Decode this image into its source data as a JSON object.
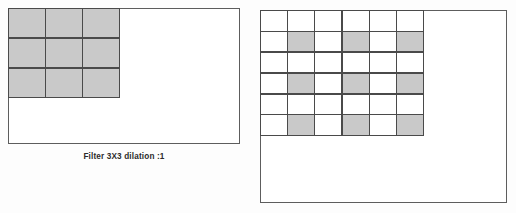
{
  "figures": [
    {
      "id": "left-filter-figure",
      "caption": "Filter 3X3 dilation :1",
      "grid": {
        "rows": 3,
        "cols": 3,
        "filled_color": "#c9c9c9",
        "empty_color": "#ffffff",
        "line_color": "#4a4a4a",
        "cells": [
          [
            1,
            1,
            1
          ],
          [
            1,
            1,
            1
          ],
          [
            1,
            1,
            1
          ]
        ]
      }
    },
    {
      "id": "right-filter-figure",
      "caption": "",
      "grid": {
        "rows": 6,
        "cols": 6,
        "filled_color": "#c9c9c9",
        "empty_color": "#ffffff",
        "line_color": "#4a4a4a",
        "cells": [
          [
            0,
            0,
            0,
            0,
            0,
            0
          ],
          [
            0,
            1,
            0,
            1,
            0,
            1
          ],
          [
            0,
            0,
            0,
            0,
            0,
            0
          ],
          [
            0,
            1,
            0,
            1,
            0,
            1
          ],
          [
            0,
            0,
            0,
            0,
            0,
            0
          ],
          [
            0,
            1,
            0,
            1,
            0,
            1
          ]
        ]
      }
    }
  ],
  "chart_data": {
    "type": "heatmap",
    "title": "Filter 3X3 dilation :1",
    "xlabel": "",
    "ylabel": "",
    "panels": [
      {
        "name": "Filter 3X3 dilation :1",
        "rows": 3,
        "cols": 3,
        "values": [
          [
            1,
            1,
            1
          ],
          [
            1,
            1,
            1
          ],
          [
            1,
            1,
            1
          ]
        ],
        "legend": [
          "0 = empty (white)",
          "1 = filter tap (gray)"
        ]
      },
      {
        "name": "Dilated receptive field 6X6",
        "rows": 6,
        "cols": 6,
        "values": [
          [
            0,
            0,
            0,
            0,
            0,
            0
          ],
          [
            0,
            1,
            0,
            1,
            0,
            1
          ],
          [
            0,
            0,
            0,
            0,
            0,
            0
          ],
          [
            0,
            1,
            0,
            1,
            0,
            1
          ],
          [
            0,
            0,
            0,
            0,
            0,
            0
          ],
          [
            0,
            1,
            0,
            1,
            0,
            1
          ]
        ],
        "legend": [
          "0 = empty (white)",
          "1 = filter tap (gray)"
        ]
      }
    ],
    "grid": true,
    "legend_position": "none"
  }
}
